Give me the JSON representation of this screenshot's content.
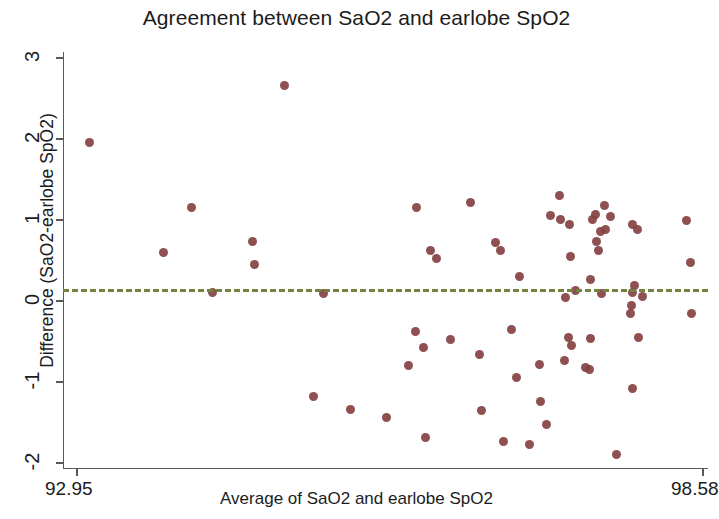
{
  "chart_data": {
    "type": "scatter",
    "title": "Agreement between SaO2 and earlobe SpO2",
    "xlabel": "Average of SaO2 and earlobe SpO2",
    "ylabel": "Difference (SaO2-earlobe SpO2)",
    "xlim": [
      92.95,
      98.58
    ],
    "ylim": [
      -2.12,
      3.1
    ],
    "x_tick_labels": [
      "92.95",
      "98.58"
    ],
    "x_ticks": [
      92.95,
      98.58
    ],
    "y_ticks": [
      3,
      2,
      1,
      0,
      -1,
      -2
    ],
    "y_tick_labels": [
      "3",
      "2",
      "1",
      "0",
      "-1",
      "-2"
    ],
    "grid": false,
    "legend": null,
    "marker_color": "#854343",
    "marker_size_px": 9,
    "reference_line": {
      "type": "horizontal-dashed",
      "value": 0.15,
      "color": "#73823f",
      "style": "dashed",
      "width_px": 3
    },
    "series": [
      {
        "name": "SaO2 vs earlobe SpO2 difference",
        "points": [
          {
            "x": 93.06,
            "y": 1.96
          },
          {
            "x": 94.82,
            "y": 2.66
          },
          {
            "x": 93.73,
            "y": 0.6
          },
          {
            "x": 93.98,
            "y": 1.15
          },
          {
            "x": 94.53,
            "y": 0.73
          },
          {
            "x": 94.55,
            "y": 0.45
          },
          {
            "x": 94.17,
            "y": 0.1
          },
          {
            "x": 95.17,
            "y": 0.09
          },
          {
            "x": 95.08,
            "y": -1.18
          },
          {
            "x": 95.41,
            "y": -1.34
          },
          {
            "x": 96.0,
            "y": 1.15
          },
          {
            "x": 96.13,
            "y": 0.62
          },
          {
            "x": 96.18,
            "y": 0.53
          },
          {
            "x": 96.49,
            "y": 1.22
          },
          {
            "x": 95.99,
            "y": -0.38
          },
          {
            "x": 96.07,
            "y": -0.58
          },
          {
            "x": 95.93,
            "y": -0.8
          },
          {
            "x": 96.31,
            "y": -0.47
          },
          {
            "x": 95.73,
            "y": -1.44
          },
          {
            "x": 96.08,
            "y": -1.68
          },
          {
            "x": 96.71,
            "y": 0.72
          },
          {
            "x": 96.76,
            "y": 0.62
          },
          {
            "x": 96.93,
            "y": 0.3
          },
          {
            "x": 96.86,
            "y": -0.35
          },
          {
            "x": 96.57,
            "y": -0.66
          },
          {
            "x": 96.9,
            "y": -0.95
          },
          {
            "x": 96.59,
            "y": -1.35
          },
          {
            "x": 96.79,
            "y": -1.74
          },
          {
            "x": 97.29,
            "y": 1.3
          },
          {
            "x": 97.21,
            "y": 1.05
          },
          {
            "x": 97.3,
            "y": 1.01
          },
          {
            "x": 97.38,
            "y": 0.95
          },
          {
            "x": 97.39,
            "y": 0.55
          },
          {
            "x": 97.43,
            "y": 0.13
          },
          {
            "x": 97.34,
            "y": 0.04
          },
          {
            "x": 97.37,
            "y": -0.45
          },
          {
            "x": 97.4,
            "y": -0.55
          },
          {
            "x": 97.33,
            "y": -0.73
          },
          {
            "x": 97.11,
            "y": -0.79
          },
          {
            "x": 97.12,
            "y": -1.24
          },
          {
            "x": 97.17,
            "y": -1.52
          },
          {
            "x": 97.02,
            "y": -1.77
          },
          {
            "x": 97.61,
            "y": 1.07
          },
          {
            "x": 97.59,
            "y": 1.01
          },
          {
            "x": 97.66,
            "y": 0.86
          },
          {
            "x": 97.62,
            "y": 0.73
          },
          {
            "x": 97.69,
            "y": 1.18
          },
          {
            "x": 97.75,
            "y": 1.04
          },
          {
            "x": 97.7,
            "y": 0.88
          },
          {
            "x": 97.64,
            "y": 0.62
          },
          {
            "x": 97.57,
            "y": 0.26
          },
          {
            "x": 97.67,
            "y": 0.09
          },
          {
            "x": 97.57,
            "y": -0.46
          },
          {
            "x": 97.52,
            "y": -0.82
          },
          {
            "x": 97.56,
            "y": -0.85
          },
          {
            "x": 97.95,
            "y": 0.95
          },
          {
            "x": 97.99,
            "y": 0.88
          },
          {
            "x": 97.96,
            "y": 0.19
          },
          {
            "x": 97.95,
            "y": 0.1
          },
          {
            "x": 97.94,
            "y": -0.06
          },
          {
            "x": 97.93,
            "y": -0.15
          },
          {
            "x": 98.0,
            "y": -0.45
          },
          {
            "x": 98.04,
            "y": 0.05
          },
          {
            "x": 97.95,
            "y": -1.08
          },
          {
            "x": 97.8,
            "y": -1.9
          },
          {
            "x": 98.43,
            "y": 1.0
          },
          {
            "x": 98.47,
            "y": 0.48
          },
          {
            "x": 98.48,
            "y": -0.15
          }
        ]
      }
    ],
    "n_points": 69
  },
  "axis": {
    "title": "Agreement between SaO2 and earlobe SpO2",
    "x_title": "Average of SaO2 and earlobe SpO2",
    "y_title": "Difference (SaO2-earlobe SpO2)"
  }
}
